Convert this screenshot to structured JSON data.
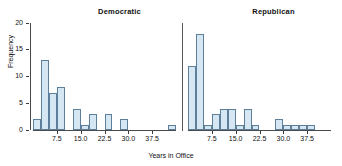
{
  "chart_data": {
    "type": "bar",
    "title": "",
    "xlabel": "Years in Office",
    "ylabel": "Frequency",
    "ylim": [
      0,
      20
    ],
    "yticks": [
      0,
      5,
      10,
      15,
      20
    ],
    "xlim": [
      0,
      45
    ],
    "xticks": [
      7.5,
      15.0,
      22.5,
      30.0,
      37.5
    ],
    "xtick_labels": [
      "7.5",
      "15.0",
      "22.5",
      "30.0",
      "37.5"
    ],
    "grid": false,
    "legend": "none",
    "bin_width": 2.5,
    "panels": [
      {
        "name": "Democratic",
        "bin_starts": [
          0.0,
          2.5,
          5.0,
          7.5,
          10.0,
          12.5,
          15.0,
          17.5,
          20.0,
          22.5,
          25.0,
          27.5,
          30.0,
          32.5,
          35.0,
          37.5,
          40.0,
          42.5
        ],
        "values": [
          2,
          13,
          7,
          8,
          0,
          4,
          1,
          3,
          0,
          3,
          0,
          2,
          0,
          0,
          0,
          0,
          0,
          1
        ]
      },
      {
        "name": "Republican",
        "bin_starts": [
          0.0,
          2.5,
          5.0,
          7.5,
          10.0,
          12.5,
          15.0,
          17.5,
          20.0,
          22.5,
          25.0,
          27.5,
          30.0,
          32.5,
          35.0,
          37.5,
          40.0
        ],
        "values": [
          12,
          18,
          1,
          3,
          4,
          4,
          1,
          4,
          1,
          0,
          0,
          2,
          1,
          1,
          1,
          1,
          0
        ]
      }
    ]
  },
  "titles": {
    "democratic": "Democratic",
    "republican": "Republican"
  },
  "axes": {
    "ylabel": "Frequency",
    "xlabel": "Years in Office",
    "ytick_labels": [
      "0",
      "5",
      "10",
      "15",
      "20"
    ],
    "xtick_labels": [
      "7.5",
      "15.0",
      "22.5",
      "30.0",
      "37.5"
    ]
  },
  "colors": {
    "bar_fill": "#d6e7f4",
    "bar_edge": "#5d7f99",
    "axis": "#4a4a4a",
    "text": "#111111",
    "background": "#ffffff"
  }
}
